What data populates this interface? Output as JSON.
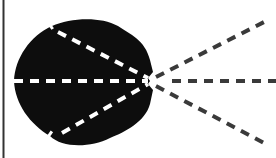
{
  "diagram": {
    "colors": {
      "background": "#ffffff",
      "shape_fill": "#0d0d0d",
      "inner_rays": "#ffffff",
      "outer_rays": "#3a3a3a",
      "border": "#333333"
    },
    "focal_point": {
      "x": 150,
      "y": 81
    },
    "rays": [
      {
        "name": "upper",
        "inner_start": {
          "x": 55,
          "y": 30
        },
        "outer_end": {
          "x": 268,
          "y": 20
        }
      },
      {
        "name": "middle",
        "inner_start": {
          "x": 14,
          "y": 81
        },
        "outer_end": {
          "x": 276,
          "y": 81
        }
      },
      {
        "name": "lower",
        "inner_start": {
          "x": 60,
          "y": 134
        },
        "outer_end": {
          "x": 268,
          "y": 145
        }
      }
    ]
  }
}
